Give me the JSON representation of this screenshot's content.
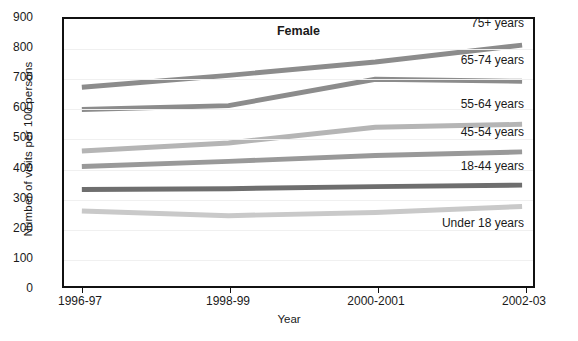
{
  "chart_data": {
    "type": "line",
    "title": "Female",
    "xlabel": "Year",
    "ylabel": "Number of visits per 100 persons",
    "categories": [
      "1996-97",
      "1998-99",
      "2000-2001",
      "2002-03"
    ],
    "ylim": [
      0,
      900
    ],
    "ytick_step": 100,
    "yticks": [
      "900",
      "800",
      "700",
      "600",
      "500",
      "400",
      "300",
      "200",
      "100",
      "0"
    ],
    "grid": true,
    "legend_position": "in-plot-right",
    "series": [
      {
        "name": "75+ years",
        "label": "75+ years",
        "color": "#8c8c8c",
        "values": [
          670,
          710,
          755,
          812
        ]
      },
      {
        "name": "65-74 years",
        "label": "65-74 years",
        "color": "#8c8c8c",
        "values": [
          595,
          608,
          697,
          690
        ]
      },
      {
        "name": "55-64 years",
        "label": "55-64 years",
        "color": "#b5b5b5",
        "values": [
          455,
          482,
          535,
          545
        ]
      },
      {
        "name": "45-54 years",
        "label": "45-54 years",
        "color": "#999999",
        "values": [
          403,
          420,
          440,
          452
        ]
      },
      {
        "name": "18-44 years",
        "label": "18-44 years",
        "color": "#6e6e6e",
        "values": [
          325,
          328,
          335,
          340
        ]
      },
      {
        "name": "Under 18 years",
        "label": "Under 18 years",
        "color": "#c9c9c9",
        "values": [
          253,
          237,
          248,
          268
        ]
      }
    ]
  }
}
